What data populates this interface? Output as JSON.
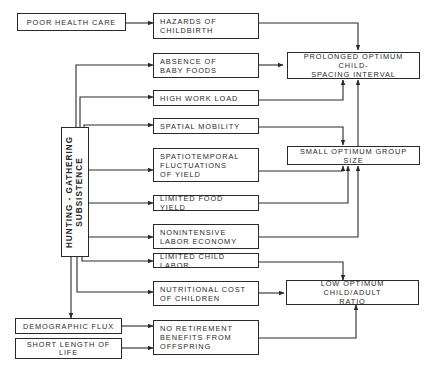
{
  "diagram": {
    "line_color": "#2a2a2a",
    "nodes": {
      "poor_health_care": "POOR HEALTH CARE",
      "hazards_childbirth": "HAZARDS OF\nCHILDBIRTH",
      "absence_baby_foods": "ABSENCE OF\nBABY FOODS",
      "high_work_load": "HIGH WORK LOAD",
      "spatial_mobility": "SPATIAL MOBILITY",
      "spatiotemporal": "SPATIOTEMPORAL\nFLUCTUATIONS\nOF YIELD",
      "limited_food_yield": "LIMITED FOOD YIELD",
      "nonintensive_labor": "NONINTENSIVE\nLABOR ECONOMY",
      "limited_child_labor": "LIMITED CHILD LABOR",
      "nutritional_cost": "NUTRITIONAL COST\nOF CHILDREN",
      "demographic_flux": "DEMOGRAPHIC FLUX",
      "short_length_life": "SHORT LENGTH OF\nLIFE",
      "no_retirement": "NO RETIREMENT\nBENEFITS FROM\nOFFSPRING",
      "hunting_gathering": "HUNTING - GATHERING\nSUBSISTENCE",
      "prolonged_spacing": "PROLONGED OPTIMUM CHILD-\nSPACING INTERVAL",
      "small_group_size": "SMALL OPTIMUM GROUP SIZE",
      "low_ratio": "LOW OPTIMUM CHILD/ADULT\nRATIO"
    },
    "edges": [
      [
        "poor_health_care",
        "hazards_childbirth"
      ],
      [
        "hunting_gathering",
        "absence_baby_foods"
      ],
      [
        "hunting_gathering",
        "high_work_load"
      ],
      [
        "hunting_gathering",
        "spatial_mobility"
      ],
      [
        "hunting_gathering",
        "spatiotemporal"
      ],
      [
        "hunting_gathering",
        "limited_food_yield"
      ],
      [
        "hunting_gathering",
        "nonintensive_labor"
      ],
      [
        "hunting_gathering",
        "limited_child_labor"
      ],
      [
        "hunting_gathering",
        "nutritional_cost"
      ],
      [
        "hunting_gathering",
        "demographic_flux"
      ],
      [
        "demographic_flux",
        "no_retirement"
      ],
      [
        "short_length_life",
        "no_retirement"
      ],
      [
        "hazards_childbirth",
        "prolonged_spacing"
      ],
      [
        "absence_baby_foods",
        "prolonged_spacing"
      ],
      [
        "high_work_load",
        "prolonged_spacing"
      ],
      [
        "small_group_size",
        "prolonged_spacing"
      ],
      [
        "spatial_mobility",
        "small_group_size"
      ],
      [
        "spatiotemporal",
        "small_group_size"
      ],
      [
        "limited_food_yield",
        "small_group_size"
      ],
      [
        "nonintensive_labor",
        "small_group_size"
      ],
      [
        "limited_child_labor",
        "low_ratio"
      ],
      [
        "nutritional_cost",
        "low_ratio"
      ],
      [
        "no_retirement",
        "low_ratio"
      ]
    ]
  }
}
